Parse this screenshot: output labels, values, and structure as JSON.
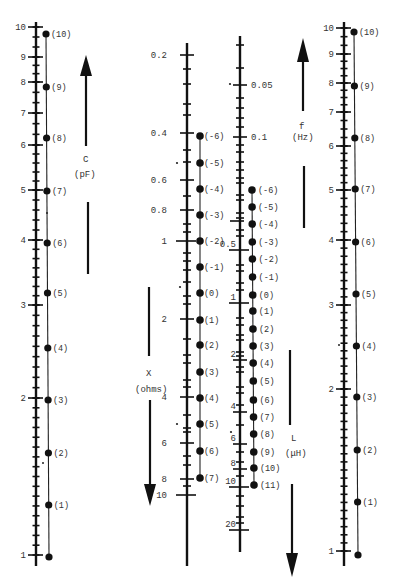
{
  "scales": {
    "C_left": {
      "name": "C",
      "unit": "(pF)",
      "x": 36,
      "tick_labels": [
        {
          "v": "10",
          "y": 27
        },
        {
          "v": "9",
          "y": 57
        },
        {
          "v": "8",
          "y": 82
        },
        {
          "v": "7",
          "y": 113
        },
        {
          "v": "6",
          "y": 145
        },
        {
          "v": "5",
          "y": 190
        },
        {
          "v": "4",
          "y": 240
        },
        {
          "v": "3",
          "y": 305
        },
        {
          "v": "2",
          "y": 398
        },
        {
          "v": "1",
          "y": 555
        }
      ],
      "points": [
        {
          "n": "(10)",
          "y": 34
        },
        {
          "n": "(9)",
          "y": 87
        },
        {
          "n": "(8)",
          "y": 138
        },
        {
          "n": "(7)",
          "y": 191
        },
        {
          "n": "(6)",
          "y": 243
        },
        {
          "n": "(5)",
          "y": 293
        },
        {
          "n": "(4)",
          "y": 348
        },
        {
          "n": "(3)",
          "y": 400
        },
        {
          "n": "(2)",
          "y": 453
        },
        {
          "n": "(1)",
          "y": 505
        },
        {
          "n": "",
          "y": 557
        }
      ]
    },
    "X": {
      "name": "X",
      "unit": "(ohms)",
      "x": 187,
      "tick_labels": [
        {
          "v": "0.2",
          "y": 55
        },
        {
          "v": "0.4",
          "y": 133
        },
        {
          "v": "0.6",
          "y": 180
        },
        {
          "v": "0.8",
          "y": 210
        },
        {
          "v": "1",
          "y": 241
        },
        {
          "v": "2",
          "y": 319
        },
        {
          "v": "4",
          "y": 397
        },
        {
          "v": "6",
          "y": 443
        },
        {
          "v": "8",
          "y": 479
        },
        {
          "v": "10",
          "y": 495
        }
      ],
      "points": [
        {
          "n": "(-6)",
          "y": 136
        },
        {
          "n": "(-5)",
          "y": 163
        },
        {
          "n": "(-4)",
          "y": 189
        },
        {
          "n": "(-3)",
          "y": 215
        },
        {
          "n": "(-2)",
          "y": 241
        },
        {
          "n": "(-1)",
          "y": 267
        },
        {
          "n": "(0)",
          "y": 293
        },
        {
          "n": "(1)",
          "y": 320
        },
        {
          "n": "(2)",
          "y": 345
        },
        {
          "n": "(3)",
          "y": 372
        },
        {
          "n": "(4)",
          "y": 398
        },
        {
          "n": "(5)",
          "y": 424
        },
        {
          "n": "(6)",
          "y": 451
        },
        {
          "n": "(7)",
          "y": 478
        }
      ]
    },
    "L": {
      "name": "L",
      "unit": "(μH)",
      "x": 240,
      "f_tick_labels": [
        {
          "v": "0.05",
          "y": 85
        },
        {
          "v": "0.1",
          "y": 137
        }
      ],
      "tick_labels": [
        {
          "v": "0.5",
          "y": 250
        },
        {
          "v": "1",
          "y": 303
        },
        {
          "v": "2",
          "y": 360
        },
        {
          "v": "4",
          "y": 412
        },
        {
          "v": "6",
          "y": 444
        },
        {
          "v": "8",
          "y": 469
        },
        {
          "v": "10",
          "y": 487
        },
        {
          "v": "20",
          "y": 530
        }
      ],
      "points": [
        {
          "n": "(-6)",
          "y": 190
        },
        {
          "n": "(-5)",
          "y": 207
        },
        {
          "n": "(-4)",
          "y": 224
        },
        {
          "n": "(-3)",
          "y": 242
        },
        {
          "n": "(-2)",
          "y": 259
        },
        {
          "n": "(-1)",
          "y": 277
        },
        {
          "n": "(0)",
          "y": 295
        },
        {
          "n": "(1)",
          "y": 311
        },
        {
          "n": "(2)",
          "y": 329
        },
        {
          "n": "(3)",
          "y": 346
        },
        {
          "n": "(4)",
          "y": 363
        },
        {
          "n": "(5)",
          "y": 381
        },
        {
          "n": "(6)",
          "y": 400
        },
        {
          "n": "(7)",
          "y": 417
        },
        {
          "n": "(8)",
          "y": 434
        },
        {
          "n": "(9)",
          "y": 452
        },
        {
          "n": "(10)",
          "y": 468
        },
        {
          "n": "(11)",
          "y": 485
        }
      ]
    },
    "C_right": {
      "name": "f",
      "unit": "(Hz)",
      "x": 344,
      "tick_labels": [
        {
          "v": "10",
          "y": 28
        },
        {
          "v": "9",
          "y": 54
        },
        {
          "v": "8",
          "y": 83
        },
        {
          "v": "7",
          "y": 112
        },
        {
          "v": "6",
          "y": 146
        },
        {
          "v": "5",
          "y": 190
        },
        {
          "v": "4",
          "y": 240
        },
        {
          "v": "3",
          "y": 305
        },
        {
          "v": "2",
          "y": 389
        },
        {
          "v": "1",
          "y": 551
        }
      ],
      "points": [
        {
          "n": "(10)",
          "y": 32
        },
        {
          "n": "(9)",
          "y": 86
        },
        {
          "n": "(8)",
          "y": 138
        },
        {
          "n": "(7)",
          "y": 189
        },
        {
          "n": "(6)",
          "y": 242
        },
        {
          "n": "(5)",
          "y": 294
        },
        {
          "n": "(4)",
          "y": 346
        },
        {
          "n": "(3)",
          "y": 397
        },
        {
          "n": "(2)",
          "y": 450
        },
        {
          "n": "(1)",
          "y": 502
        },
        {
          "n": "",
          "y": 555
        }
      ]
    }
  },
  "labels": {
    "c_name": "C",
    "c_unit": "(pF)",
    "x_name": "X",
    "x_unit": "(ohms)",
    "f_name": "f",
    "f_unit": "(Hz)",
    "l_name": "L",
    "l_unit": "(μH)"
  },
  "colors": {
    "ink": "#111111",
    "label": "#333333",
    "background": "#ffffff"
  }
}
